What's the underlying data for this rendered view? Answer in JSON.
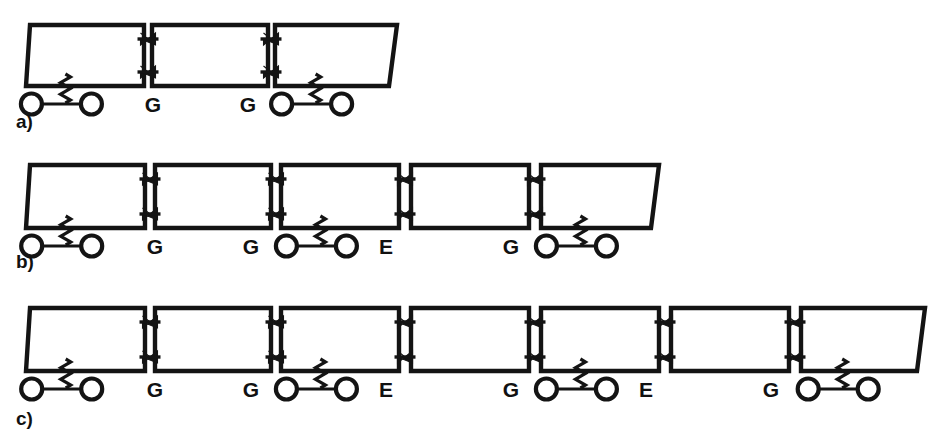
{
  "figure": {
    "kind": "train-consist-diagram",
    "background_color": "#ffffff",
    "line_color": "#141414",
    "width": 941,
    "height": 447,
    "rows": [
      {
        "id": "a",
        "label": "a)",
        "label_x": 16,
        "label_y": 128,
        "box_top": 25,
        "box_bottom": 86,
        "cars": [
          {
            "x": 26,
            "width": 118,
            "skew_left": 4,
            "skew_right": 0,
            "bogie": "left"
          },
          {
            "x": 152,
            "width": 116,
            "skew_left": 0,
            "skew_right": 0,
            "bogie": "none"
          },
          {
            "x": 275,
            "width": 122,
            "skew_left": 0,
            "skew_right": -8,
            "bogie": "left"
          }
        ],
        "couplers": [
          {
            "label": "G",
            "gap_center": 148,
            "label_x": 153,
            "label_y": 112
          },
          {
            "label": "G",
            "gap_center": 271,
            "label_x": 248,
            "label_y": 112
          }
        ]
      },
      {
        "id": "b",
        "label": "b)",
        "label_x": 16,
        "label_y": 268,
        "box_top": 165,
        "box_bottom": 228,
        "cars": [
          {
            "x": 26,
            "width": 119,
            "skew_left": 4,
            "skew_right": 0,
            "bogie": "left"
          },
          {
            "x": 155,
            "width": 116,
            "skew_left": 0,
            "skew_right": 0,
            "bogie": "none"
          },
          {
            "x": 281,
            "width": 118,
            "skew_left": 0,
            "skew_right": 0,
            "bogie": "left"
          },
          {
            "x": 411,
            "width": 118,
            "skew_left": 0,
            "skew_right": 0,
            "bogie": "none"
          },
          {
            "x": 541,
            "width": 118,
            "skew_left": 0,
            "skew_right": -8,
            "bogie": "left"
          }
        ],
        "couplers": [
          {
            "label": "G",
            "gap_center": 150,
            "label_x": 155,
            "label_y": 254
          },
          {
            "label": "G",
            "gap_center": 276,
            "label_x": 251,
            "label_y": 254
          },
          {
            "label": "E",
            "gap_center": 405,
            "label_x": 386,
            "label_y": 254
          },
          {
            "label": "G",
            "gap_center": 535,
            "label_x": 511,
            "label_y": 254
          }
        ]
      },
      {
        "id": "c",
        "label": "c)",
        "label_x": 16,
        "label_y": 425,
        "box_top": 308,
        "box_bottom": 371,
        "cars": [
          {
            "x": 26,
            "width": 119,
            "skew_left": 4,
            "skew_right": 0,
            "bogie": "left"
          },
          {
            "x": 155,
            "width": 116,
            "skew_left": 0,
            "skew_right": 0,
            "bogie": "none"
          },
          {
            "x": 281,
            "width": 118,
            "skew_left": 0,
            "skew_right": 0,
            "bogie": "left"
          },
          {
            "x": 411,
            "width": 118,
            "skew_left": 0,
            "skew_right": 0,
            "bogie": "none"
          },
          {
            "x": 541,
            "width": 118,
            "skew_left": 0,
            "skew_right": 0,
            "bogie": "left"
          },
          {
            "x": 671,
            "width": 118,
            "skew_left": 0,
            "skew_right": 0,
            "bogie": "none"
          },
          {
            "x": 801,
            "width": 124,
            "skew_left": 0,
            "skew_right": -8,
            "bogie": "left"
          }
        ],
        "couplers": [
          {
            "label": "G",
            "gap_center": 150,
            "label_x": 155,
            "label_y": 397
          },
          {
            "label": "G",
            "gap_center": 276,
            "label_x": 251,
            "label_y": 397
          },
          {
            "label": "E",
            "gap_center": 405,
            "label_x": 386,
            "label_y": 397
          },
          {
            "label": "G",
            "gap_center": 535,
            "label_x": 511,
            "label_y": 397
          },
          {
            "label": "E",
            "gap_center": 665,
            "label_x": 646,
            "label_y": 397
          },
          {
            "label": "G",
            "gap_center": 795,
            "label_x": 771,
            "label_y": 397
          }
        ]
      }
    ]
  },
  "legend_symbols": {
    "G": "G",
    "E": "E"
  }
}
